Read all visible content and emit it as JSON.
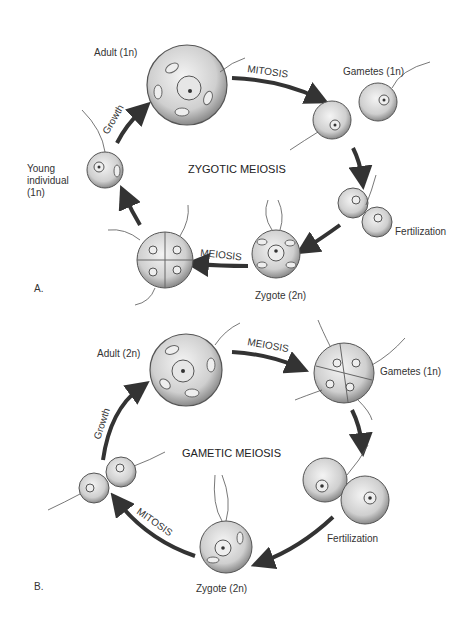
{
  "panelA": {
    "panel_label": "A.",
    "title": "ZYGOTIC MEIOSIS",
    "stages": {
      "adult": "Adult (1n)",
      "gametes": "Gametes (1n)",
      "fertilization": "Fertilization",
      "zygote": "Zygote (2n)",
      "young_l1": "Young",
      "young_l2": "individual",
      "young_l3": "(1n)"
    },
    "processes": {
      "mitosis": "MITOSIS",
      "meiosis": "MEIOSIS",
      "growth": "Growth"
    }
  },
  "panelB": {
    "panel_label": "B.",
    "title": "GAMETIC MEIOSIS",
    "stages": {
      "adult": "Adult (2n)",
      "gametes": "Gametes (1n)",
      "fertilization": "Fertilization",
      "zygote": "Zygote (2n)"
    },
    "processes": {
      "meiosis": "MEIOSIS",
      "mitosis": "MITOSIS",
      "growth": "Growth"
    }
  },
  "colors": {
    "ink": "#2a2a2a",
    "cell_fill": "#d9d9d9",
    "cell_edge": "#555555",
    "arrow": "#333333"
  }
}
